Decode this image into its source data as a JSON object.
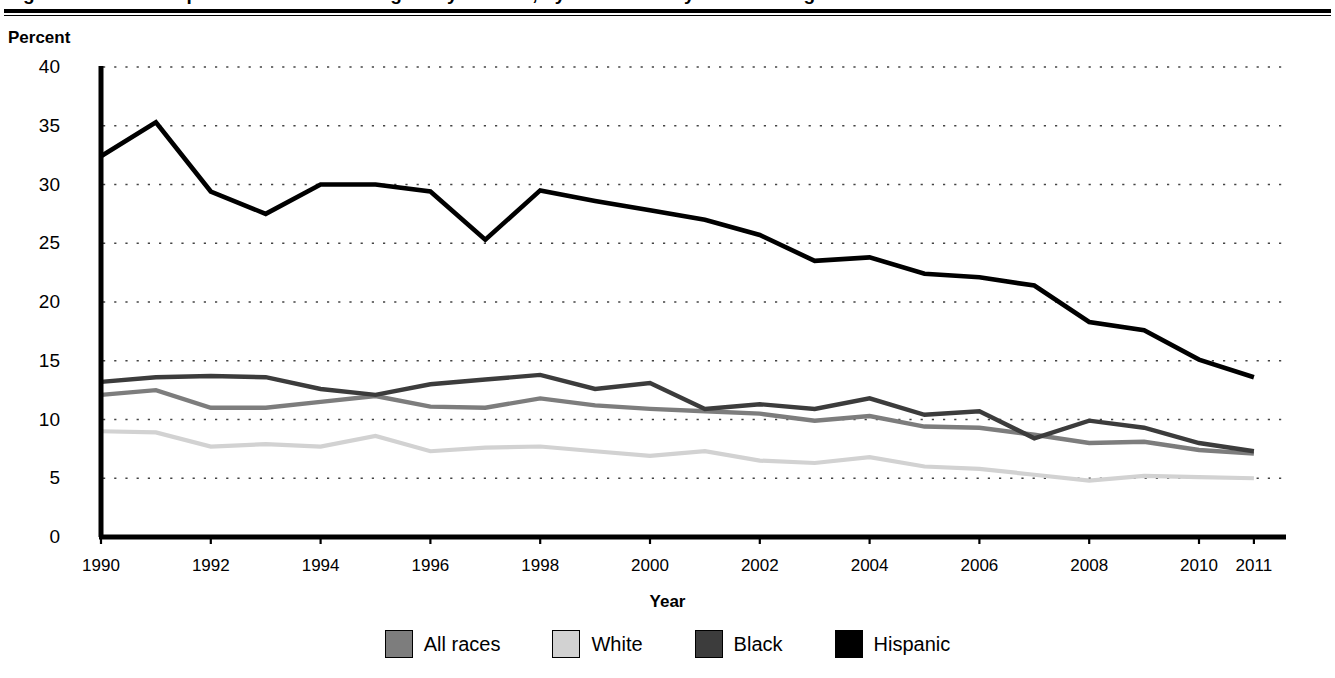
{
  "figure": {
    "title_cropped": "Figure 1. Status dropout rates of 16- through 24-year-olds, by race/ethnicity: 1990 through 2011",
    "y_axis_title": "Percent",
    "x_axis_title": "Year"
  },
  "y_ticks": [
    "0",
    "5",
    "10",
    "15",
    "20",
    "25",
    "30",
    "35",
    "40"
  ],
  "x_ticks": [
    "1990",
    "1992",
    "1994",
    "1996",
    "1998",
    "2000",
    "2002",
    "2004",
    "2006",
    "2008",
    "2010",
    "2011"
  ],
  "legend": {
    "items": [
      {
        "label": "All races",
        "color": "#7d7d7d"
      },
      {
        "label": "White",
        "color": "#d2d2d2"
      },
      {
        "label": "Black",
        "color": "#3c3c3c"
      },
      {
        "label": "Hispanic",
        "color": "#000000"
      }
    ]
  },
  "chart_data": {
    "type": "line",
    "title": "Status dropout rates of 16- through 24-year-olds, by race/ethnicity: 1990 through 2011",
    "xlabel": "Year",
    "ylabel": "Percent",
    "ylim": [
      0,
      40
    ],
    "ytick_step": 5,
    "xlim": [
      1990,
      2011
    ],
    "grid": "horizontal-dotted",
    "legend_position": "bottom",
    "x": [
      1990,
      1991,
      1992,
      1993,
      1994,
      1995,
      1996,
      1997,
      1998,
      1999,
      2000,
      2001,
      2002,
      2003,
      2004,
      2005,
      2006,
      2007,
      2008,
      2009,
      2010,
      2011
    ],
    "series": [
      {
        "name": "All races",
        "color": "#7d7d7d",
        "values": [
          12.1,
          12.5,
          11.0,
          11.0,
          11.5,
          12.0,
          11.1,
          11.0,
          11.8,
          11.2,
          10.9,
          10.7,
          10.5,
          9.9,
          10.3,
          9.4,
          9.3,
          8.7,
          8.0,
          8.1,
          7.4,
          7.1
        ]
      },
      {
        "name": "White",
        "color": "#d2d2d2",
        "values": [
          9.0,
          8.9,
          7.7,
          7.9,
          7.7,
          8.6,
          7.3,
          7.6,
          7.7,
          7.3,
          6.9,
          7.3,
          6.5,
          6.3,
          6.8,
          6.0,
          5.8,
          5.3,
          4.8,
          5.2,
          5.1,
          5.0
        ]
      },
      {
        "name": "Black",
        "color": "#3c3c3c",
        "values": [
          13.2,
          13.6,
          13.7,
          13.6,
          12.6,
          12.1,
          13.0,
          13.4,
          13.8,
          12.6,
          13.1,
          10.9,
          11.3,
          10.9,
          11.8,
          10.4,
          10.7,
          8.4,
          9.9,
          9.3,
          8.0,
          7.3
        ]
      },
      {
        "name": "Hispanic",
        "color": "#000000",
        "values": [
          32.4,
          35.3,
          29.4,
          27.5,
          30.0,
          30.0,
          29.4,
          25.3,
          29.5,
          28.6,
          27.8,
          27.0,
          25.7,
          23.5,
          23.8,
          22.4,
          22.1,
          21.4,
          18.3,
          17.6,
          15.1,
          13.6
        ]
      }
    ]
  }
}
